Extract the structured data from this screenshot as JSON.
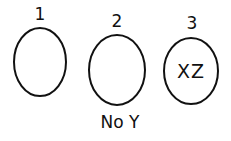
{
  "diagram": {
    "sets": [
      {
        "number": "1",
        "content": "",
        "caption": ""
      },
      {
        "number": "2",
        "content": "",
        "caption": "No Y"
      },
      {
        "number": "3",
        "content": "XZ",
        "caption": ""
      }
    ],
    "stroke_color": "#111111",
    "background": "#ffffff"
  }
}
